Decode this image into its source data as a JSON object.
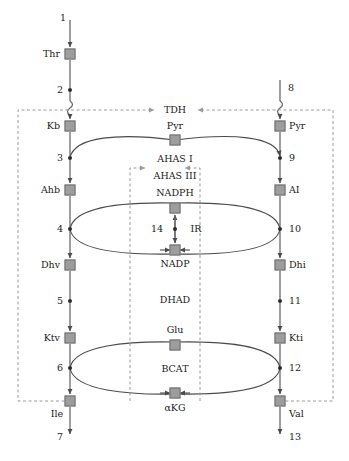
{
  "diagram": {
    "type": "metabolic-pathway",
    "colors": {
      "metabolite_box_fill": "#9d9d9d",
      "metabolite_box_stroke": "#6f6f6f",
      "flux_dot": "#2a2a2a",
      "arrow": "#5a5a5a",
      "dashed_regulation": "#9a9a9a",
      "text": "#1a1a1a"
    },
    "left_branch": {
      "name": "isoleucine-branch",
      "metabolites": [
        {
          "id": "thr",
          "label": "Thr",
          "x": 70,
          "y": 54
        },
        {
          "id": "kb",
          "label": "Kb",
          "x": 70,
          "y": 126
        },
        {
          "id": "ahb",
          "label": "Ahb",
          "x": 70,
          "y": 190
        },
        {
          "id": "dhv",
          "label": "Dhv",
          "x": 70,
          "y": 265
        },
        {
          "id": "ktv",
          "label": "Ktv",
          "x": 70,
          "y": 338
        },
        {
          "id": "ile",
          "label": "Ile",
          "x": 70,
          "y": 401
        }
      ],
      "fluxes": [
        {
          "id": "v1",
          "label": "1",
          "x": 70,
          "y": 18,
          "type": "input"
        },
        {
          "id": "v2",
          "label": "2",
          "x": 70,
          "y": 90,
          "type": "node"
        },
        {
          "id": "v3",
          "label": "3",
          "x": 70,
          "y": 158,
          "type": "node"
        },
        {
          "id": "v4",
          "label": "4",
          "x": 70,
          "y": 229,
          "type": "node"
        },
        {
          "id": "v5",
          "label": "5",
          "x": 70,
          "y": 301,
          "type": "node"
        },
        {
          "id": "v6",
          "label": "6",
          "x": 70,
          "y": 368,
          "type": "node"
        },
        {
          "id": "v7",
          "label": "7",
          "x": 70,
          "y": 437,
          "type": "output"
        }
      ]
    },
    "right_branch": {
      "name": "valine-branch",
      "metabolites": [
        {
          "id": "pyr_r",
          "label": "Pyr",
          "x": 280,
          "y": 126
        },
        {
          "id": "ai",
          "label": "AI",
          "x": 280,
          "y": 190
        },
        {
          "id": "dhi",
          "label": "Dhi",
          "x": 280,
          "y": 265
        },
        {
          "id": "kti",
          "label": "Kti",
          "x": 280,
          "y": 338
        },
        {
          "id": "val",
          "label": "Val",
          "x": 280,
          "y": 401
        }
      ],
      "fluxes": [
        {
          "id": "v8",
          "label": "8",
          "x": 280,
          "y": 90,
          "type": "input"
        },
        {
          "id": "v9",
          "label": "9",
          "x": 280,
          "y": 158,
          "type": "node"
        },
        {
          "id": "v10",
          "label": "10",
          "x": 280,
          "y": 229,
          "type": "node"
        },
        {
          "id": "v11",
          "label": "11",
          "x": 280,
          "y": 301,
          "type": "node"
        },
        {
          "id": "v12",
          "label": "12",
          "x": 280,
          "y": 368,
          "type": "node"
        },
        {
          "id": "v13",
          "label": "13",
          "x": 280,
          "y": 437,
          "type": "output"
        }
      ]
    },
    "cofactors": [
      {
        "id": "pyr_c",
        "label": "Pyr",
        "x": 175,
        "y": 140,
        "label_y": 126
      },
      {
        "id": "nadph",
        "label": "NADPH",
        "x": 175,
        "y": 208,
        "label_y": 193
      },
      {
        "id": "nadp",
        "label": "NADP",
        "x": 175,
        "y": 250,
        "label_y": 264
      },
      {
        "id": "glu",
        "label": "Glu",
        "x": 175,
        "y": 345,
        "label_y": 330
      },
      {
        "id": "akg",
        "label": "αKG",
        "x": 175,
        "y": 393,
        "label_y": 408
      }
    ],
    "enzymes": [
      {
        "id": "tdh",
        "label": "TDH",
        "x": 175,
        "y": 110
      },
      {
        "id": "ahas1",
        "label": "AHAS I",
        "x": 175,
        "y": 159
      },
      {
        "id": "ahas3",
        "label": "AHAS III",
        "x": 175,
        "y": 176
      },
      {
        "id": "ir",
        "label": "IR",
        "x": 190,
        "y": 229
      },
      {
        "id": "dhad",
        "label": "DHAD",
        "x": 175,
        "y": 300
      },
      {
        "id": "bcat",
        "label": "BCAT",
        "x": 175,
        "y": 369
      }
    ],
    "shared_flux": {
      "id": "v14",
      "label": "14",
      "x": 160,
      "y": 229,
      "dot_x": 175
    },
    "regulation": {
      "left_feedback_box": {
        "x": 18,
        "y": 107,
        "width": 112,
        "height": 294,
        "target": "tdh",
        "source": "ile"
      },
      "right_feedback_box": {
        "x": 200,
        "y": 107,
        "width": 133,
        "height": 294,
        "target": "ahas",
        "source": "val"
      },
      "inner_ahas_box": {
        "x": 130,
        "y": 163,
        "width": 70,
        "height": 238
      },
      "tdh_line_y": 110,
      "arrow_labels": [
        "TDH",
        "AHAS I",
        "AHAS III"
      ]
    }
  }
}
